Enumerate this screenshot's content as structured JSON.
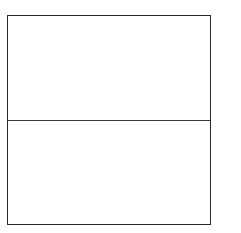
{
  "diagram": {
    "type": "two-panel-box",
    "panels": [
      {
        "position": "top",
        "text": ""
      },
      {
        "position": "bottom",
        "text": ""
      }
    ],
    "colors": {
      "border": "#2b2b2b",
      "divider": "#3a3a3a",
      "background": "#ffffff"
    }
  }
}
